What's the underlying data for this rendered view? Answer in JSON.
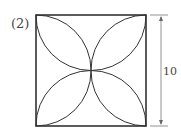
{
  "figure": {
    "label": "(2)",
    "dimension_label": "10",
    "shape": "square with four quarter-circle-arc petals meeting at center",
    "side_length": 10,
    "stroke_color": "#333333"
  }
}
